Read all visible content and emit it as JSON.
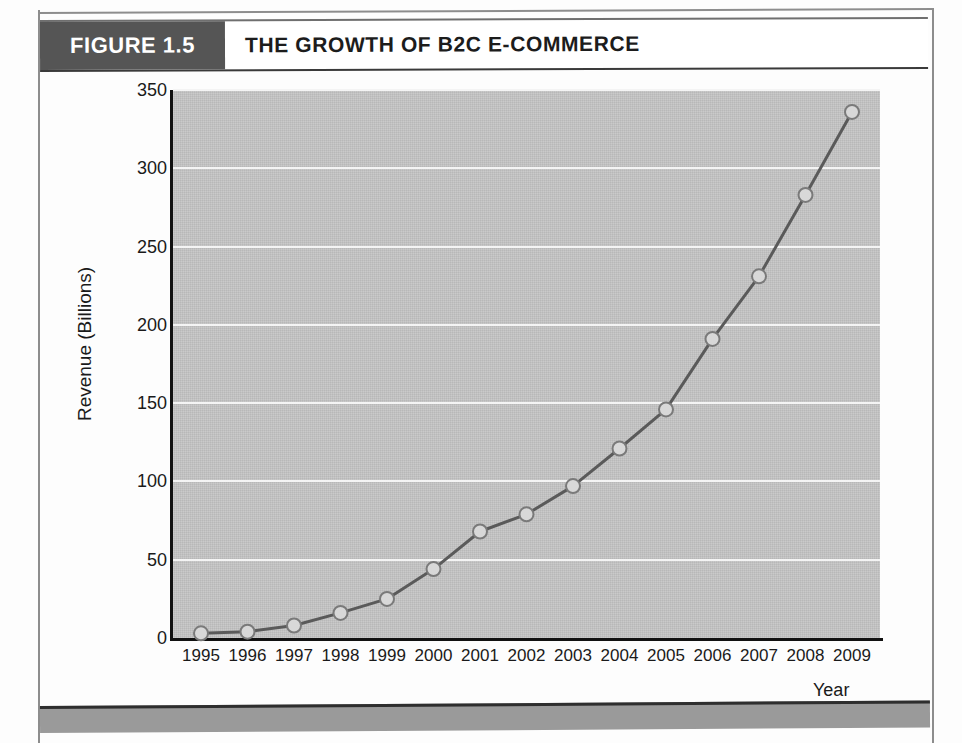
{
  "header": {
    "figure_tag": "FIGURE 1.5",
    "title": "THE GROWTH OF B2C E-COMMERCE",
    "tag_background": "#555555",
    "tag_text_color": "#ffffff"
  },
  "footer": {
    "separator_color": "#9a9a9a"
  },
  "chart_data": {
    "type": "line",
    "title": "THE GROWTH OF B2C E-COMMERCE",
    "xlabel": "Year",
    "ylabel": "Revenue (Billions)",
    "categories": [
      "1995",
      "1996",
      "1997",
      "1998",
      "1999",
      "2000",
      "2001",
      "2002",
      "2003",
      "2004",
      "2005",
      "2006",
      "2007",
      "2008",
      "2009"
    ],
    "values": [
      3,
      4,
      8,
      16,
      25,
      44,
      68,
      79,
      97,
      121,
      146,
      191,
      231,
      283,
      336
    ],
    "ylim": [
      0,
      350
    ],
    "yticks": [
      0,
      50,
      100,
      150,
      200,
      250,
      300,
      350
    ],
    "grid": true,
    "legend": "none",
    "series": [
      {
        "name": "B2C E-commerce Revenue",
        "values": [
          3,
          4,
          8,
          16,
          25,
          44,
          68,
          79,
          97,
          121,
          146,
          191,
          231,
          283,
          336
        ]
      }
    ],
    "style": {
      "plot_background": "#c4c4c4",
      "gridline_color": "#f4f4f4",
      "line_color": "#5a5a5a",
      "marker_fill": "#d8d8d8",
      "marker_edge": "#7a7a7a",
      "axis_color": "#111111"
    }
  }
}
